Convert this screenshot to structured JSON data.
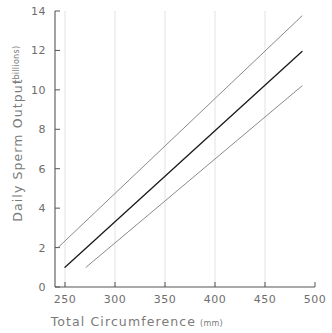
{
  "chart_data": {
    "type": "line",
    "title": "",
    "xlabel": "Total Circumference",
    "xlabel_unit": "(mm)",
    "ylabel": "Daily Sperm Output",
    "ylabel_unit": "(billions)",
    "xlim": [
      240,
      500
    ],
    "ylim": [
      0,
      14
    ],
    "xticks": [
      250,
      300,
      350,
      400,
      450,
      500
    ],
    "yticks": [
      0,
      2,
      4,
      6,
      8,
      10,
      12,
      14
    ],
    "xtick_labels": [
      "250",
      "300",
      "350",
      "400",
      "450",
      "500"
    ],
    "ytick_labels": [
      "0",
      "2",
      "4",
      "6",
      "8",
      "10",
      "12",
      "14"
    ],
    "grid": "vertical-only",
    "legend": "none",
    "series": [
      {
        "name": "upper-confidence-band",
        "color": "#8a8a8a",
        "width": 1,
        "x": [
          243,
          487
        ],
        "values": [
          2.0,
          13.75
        ]
      },
      {
        "name": "fitted-regression-line",
        "color": "#1a1a1a",
        "width": 1.3,
        "x": [
          250,
          487
        ],
        "values": [
          1.0,
          11.95
        ]
      },
      {
        "name": "lower-confidence-band",
        "color": "#8a8a8a",
        "width": 1,
        "x": [
          271,
          487
        ],
        "values": [
          1.0,
          10.2
        ]
      }
    ],
    "colors": {
      "axis": "#555555",
      "grid": "#e2e2e2",
      "text": "#7a7a7a",
      "background": "#ffffff"
    }
  }
}
